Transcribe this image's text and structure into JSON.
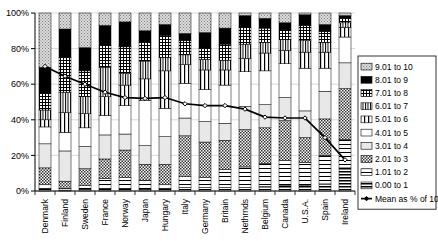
{
  "chart_data": {
    "type": "bar",
    "subtype": "stacked-100-percent-with-line-overlay",
    "title": "",
    "subtitle": "",
    "xlabel": "",
    "ylabel": "",
    "ylim": [
      0,
      100
    ],
    "yticks": [
      0,
      20,
      40,
      60,
      80,
      100
    ],
    "ytick_labels": [
      "0%",
      "20%",
      "40%",
      "60%",
      "80%",
      "100%"
    ],
    "grid": true,
    "legend_position": "right",
    "stack_order": "bottom-to-top",
    "categories": [
      "Denmark",
      "Finland",
      "Sweden",
      "France",
      "Norway",
      "Japan",
      "Hungary",
      "Italy",
      "Germany",
      "Britain",
      "Nethrnds",
      "Belgium",
      "Canada",
      "U.S.A.",
      "Spain",
      "Ireland"
    ],
    "series": [
      {
        "name": "0.00 to 1",
        "pattern": "horizontal-lines-dense",
        "values": [
          1.5,
          0.5,
          1.0,
          1.5,
          1.5,
          1.0,
          1.5,
          2.0,
          2.0,
          2.0,
          2.0,
          2.5,
          3.0,
          3.0,
          4.0,
          13.0
        ]
      },
      {
        "name": "1.01 to 2",
        "pattern": "horizontal-lines-wide",
        "values": [
          2.0,
          1.0,
          2.0,
          5.5,
          6.0,
          5.0,
          2.0,
          6.0,
          5.5,
          10.0,
          11.5,
          13.0,
          14.0,
          13.0,
          16.0,
          16.0
        ]
      },
      {
        "name": "2.01 to 3",
        "pattern": "checker-dense",
        "values": [
          9.5,
          4.0,
          9.5,
          11.0,
          15.5,
          9.0,
          11.5,
          23.0,
          20.0,
          16.5,
          21.0,
          20.0,
          22.5,
          14.0,
          20.5,
          28.5
        ]
      },
      {
        "name": "3.01 to 4",
        "pattern": "light-gray-solid",
        "values": [
          13.5,
          17.0,
          12.5,
          13.5,
          9.0,
          10.5,
          15.5,
          10.0,
          11.5,
          9.5,
          13.0,
          13.0,
          13.0,
          15.0,
          15.5,
          14.5
        ]
      },
      {
        "name": "4.01 to 5",
        "pattern": "white-solid",
        "values": [
          9.5,
          10.5,
          10.5,
          11.0,
          16.0,
          25.5,
          16.0,
          19.5,
          18.0,
          21.5,
          19.5,
          19.0,
          19.0,
          24.0,
          13.0,
          14.5
        ]
      },
      {
        "name": "5.01 to 6",
        "pattern": "vertical-lines-medium",
        "values": [
          4.0,
          11.0,
          8.0,
          10.5,
          11.5,
          12.0,
          21.0,
          10.5,
          11.0,
          8.5,
          7.5,
          10.0,
          7.5,
          9.0,
          9.0,
          5.5
        ]
      },
      {
        "name": "6.01 to 7",
        "pattern": "vertical-lines-dense",
        "values": [
          5.5,
          11.5,
          9.5,
          16.5,
          6.5,
          10.0,
          7.5,
          5.5,
          6.0,
          5.5,
          8.0,
          6.0,
          6.0,
          6.5,
          5.5,
          2.5
        ]
      },
      {
        "name": "7.01 to 8",
        "pattern": "crosshatch-grid",
        "values": [
          9.5,
          19.5,
          14.5,
          12.5,
          15.0,
          10.5,
          12.5,
          8.0,
          6.0,
          9.0,
          9.5,
          8.0,
          5.5,
          8.5,
          6.0,
          2.5
        ]
      },
      {
        "name": "8.01 to 9",
        "pattern": "solid-black",
        "values": [
          14.5,
          16.0,
          13.0,
          11.0,
          14.0,
          6.5,
          6.0,
          4.0,
          9.0,
          9.0,
          6.5,
          5.5,
          4.0,
          6.0,
          4.0,
          1.5
        ]
      },
      {
        "name": "9.01 to 10",
        "pattern": "dotted-gray",
        "values": [
          30.5,
          9.0,
          19.5,
          7.0,
          5.0,
          10.0,
          6.5,
          11.5,
          11.0,
          8.5,
          1.5,
          3.0,
          5.5,
          1.0,
          6.5,
          1.5
        ]
      }
    ],
    "overlay_line": {
      "name": "Mean as % of 10",
      "marker": "diamond",
      "values": [
        70.0,
        64.5,
        60.0,
        55.5,
        52.5,
        52.0,
        52.5,
        49.0,
        48.0,
        48.0,
        46.0,
        41.5,
        41.0,
        41.0,
        30.0,
        17.5
      ]
    }
  },
  "legend": {
    "entries": [
      {
        "label": "9.01 to 10"
      },
      {
        "label": "8.01 to 9"
      },
      {
        "label": "7.01 to 8"
      },
      {
        "label": "6.01 to 7"
      },
      {
        "label": "5.01 to 6"
      },
      {
        "label": "4.01 to 5"
      },
      {
        "label": "3.01 to 4"
      },
      {
        "label": "2.01 to 3"
      },
      {
        "label": "1.01 to 2"
      },
      {
        "label": "0.00 to 1"
      },
      {
        "label": "Mean as % of 10"
      }
    ]
  },
  "colors": {
    "axis": "#000000",
    "grid": "#c8c8c8",
    "line": "#000000",
    "solid_black": "#000000",
    "light_gray": "#e8e8e8",
    "white": "#ffffff",
    "dot_gray": "#b5b5b5",
    "background": "#ffffff"
  }
}
